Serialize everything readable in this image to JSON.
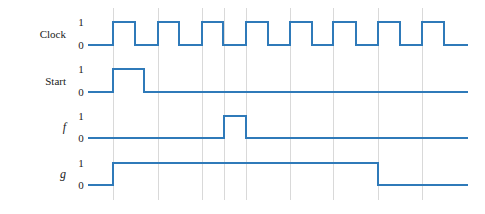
{
  "figure": {
    "type": "digital-timing-diagram",
    "background_color": "#ffffff",
    "waveform_color": "#2f7ab9",
    "gridline_color": "#d9d9d9",
    "text_color": "#1a1a1a"
  },
  "signals": [
    {
      "name": "Clock",
      "italic": false,
      "high_label": "1",
      "low_label": "0"
    },
    {
      "name": "Start",
      "italic": false,
      "high_label": "1",
      "low_label": "0"
    },
    {
      "name": "f",
      "italic": true,
      "high_label": "1",
      "low_label": "0"
    },
    {
      "name": "g",
      "italic": true,
      "high_label": "1",
      "low_label": "0"
    }
  ],
  "chart_data": {
    "type": "line",
    "title": "",
    "xlabel": "",
    "ylabel": "",
    "grid": true,
    "legend": "none",
    "axis": {
      "x_start": 88,
      "x_end": 468,
      "gridlines_x": [
        113,
        158,
        202,
        224,
        246,
        290,
        333,
        378,
        422
      ]
    },
    "series": [
      {
        "name": "Clock",
        "row_y_high": 22,
        "row_y_low": 45,
        "transitions": [
          {
            "x": 88,
            "level": 0
          },
          {
            "x": 113,
            "level": 1
          },
          {
            "x": 135,
            "level": 0
          },
          {
            "x": 158,
            "level": 1
          },
          {
            "x": 179,
            "level": 0
          },
          {
            "x": 202,
            "level": 1
          },
          {
            "x": 223,
            "level": 0
          },
          {
            "x": 246,
            "level": 1
          },
          {
            "x": 268,
            "level": 0
          },
          {
            "x": 290,
            "level": 1
          },
          {
            "x": 312,
            "level": 0
          },
          {
            "x": 333,
            "level": 1
          },
          {
            "x": 356,
            "level": 0
          },
          {
            "x": 378,
            "level": 1
          },
          {
            "x": 400,
            "level": 0
          },
          {
            "x": 422,
            "level": 1
          },
          {
            "x": 444,
            "level": 0
          },
          {
            "x": 468,
            "level": 0
          }
        ]
      },
      {
        "name": "Start",
        "row_y_high": 69,
        "row_y_low": 92,
        "transitions": [
          {
            "x": 88,
            "level": 0
          },
          {
            "x": 113,
            "level": 1
          },
          {
            "x": 144,
            "level": 0
          },
          {
            "x": 468,
            "level": 0
          }
        ]
      },
      {
        "name": "f",
        "row_y_high": 116,
        "row_y_low": 138,
        "transitions": [
          {
            "x": 88,
            "level": 0
          },
          {
            "x": 224,
            "level": 1
          },
          {
            "x": 246,
            "level": 0
          },
          {
            "x": 468,
            "level": 0
          }
        ]
      },
      {
        "name": "g",
        "row_y_high": 163,
        "row_y_low": 185,
        "transitions": [
          {
            "x": 88,
            "level": 0
          },
          {
            "x": 113,
            "level": 1
          },
          {
            "x": 378,
            "level": 0
          },
          {
            "x": 468,
            "level": 0
          }
        ]
      }
    ]
  },
  "layout": {
    "label_x": 66,
    "level_label_x": 81,
    "grid_y_top": 8,
    "grid_y_bottom": 200
  }
}
